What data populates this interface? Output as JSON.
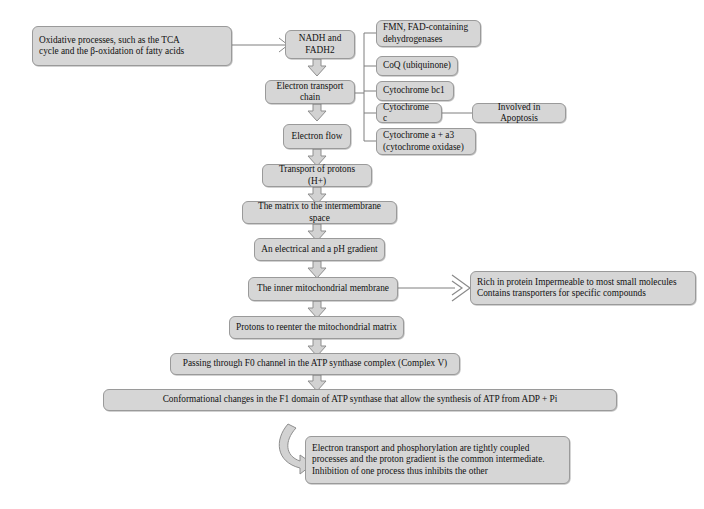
{
  "diagram": {
    "colors": {
      "node_fill": "#d6d6d6",
      "node_border": "#9a9a9a",
      "connector": "#8a8a8a",
      "background": "#ffffff"
    },
    "nodes": {
      "oxidative_processes": "Oxidative processes, such as the TCA\ncycle and the β-oxidation of fatty acids",
      "nadh_fadh2": "NADH and FADH2",
      "electron_transport_chain": "Electron transport chain",
      "electron_flow": "Electron flow",
      "transport_of_protons": "Transport of protons (H+)",
      "matrix_to_intermembrane": "The matrix to the intermembrane space",
      "electrical_ph_gradient": "An electrical and a pH gradient",
      "inner_mitochondrial_membrane": "The inner mitochondrial membrane",
      "protons_reenter": "Protons to reenter the mitochondrial matrix",
      "passing_f0_channel": "Passing through F0 channel in the ATP synthase complex (Complex V)",
      "conformational_changes": "Conformational changes in the F1 domain of ATP synthase that allow the synthesis of ATP from ADP + Pi",
      "membrane_properties": "Rich in protein Impermeable to most small molecules\nContains transporters for specific compounds",
      "coupling_note": "Electron transport and phosphorylation are tightly coupled\nprocesses and the proton gradient is the common intermediate.\nInhibition of one process thus inhibits the other",
      "apoptosis": "Involved in Apoptosis"
    },
    "etc_components": [
      "FMN, FAD-containing\ndehydrogenases",
      "CoQ (ubiquinone)",
      "Cytochrome bc1",
      "Cytochrome c",
      "Cytochrome a + a3\n(cytochrome oxidase)"
    ]
  }
}
